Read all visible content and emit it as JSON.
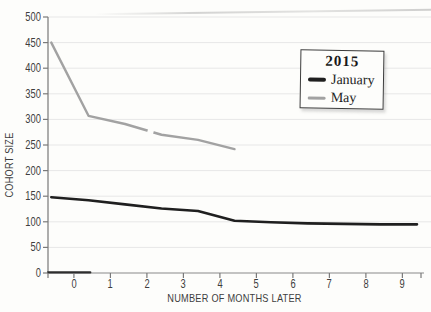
{
  "colors": {
    "axis": "#8a8a8a",
    "tick": "#7a7a7a",
    "gridline": "#e7e7e7",
    "axis_dark_segment": "#2e2e2e",
    "background": "#fdfdfb",
    "text": "#3e3e3e"
  },
  "chart_data": {
    "type": "line",
    "title": "",
    "xlabel": "NUMBER OF MONTHS LATER",
    "ylabel": "COHORT SIZE",
    "x_ticks": [
      0,
      1,
      2,
      3,
      4,
      5,
      6,
      7,
      8,
      9
    ],
    "y_ticks": [
      0,
      50,
      100,
      150,
      200,
      250,
      300,
      350,
      400,
      450,
      500
    ],
    "xlim": [
      -0.71,
      9.51
    ],
    "ylim": [
      0,
      500
    ],
    "grid": "horizontal-only",
    "legend": {
      "title": "2015",
      "position": "upper-right"
    },
    "series": [
      {
        "name": "January",
        "color": "#1f1f1f",
        "width": 2.6,
        "x": [
          -0.62,
          0.4,
          1.4,
          2.4,
          3.4,
          4.4,
          5.4,
          6.4,
          7.4,
          8.4,
          9.4
        ],
        "y": [
          148,
          142,
          134,
          126,
          121,
          102,
          99,
          97,
          96,
          95,
          95
        ]
      },
      {
        "name": "May",
        "color": "#a2a2a2",
        "width": 2.4,
        "x": [
          -0.62,
          0.4,
          1.4,
          2.4,
          3.4,
          4.4
        ],
        "y": [
          450,
          307,
          291,
          270,
          260,
          242
        ]
      }
    ]
  }
}
